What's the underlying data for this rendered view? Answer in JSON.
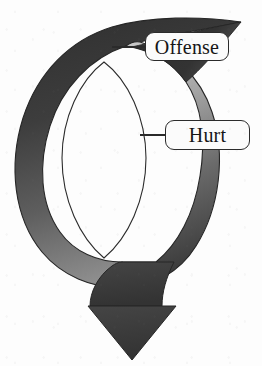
{
  "diagram": {
    "type": "cyclical-loop-arrow",
    "background_color": "#fdfdfd",
    "callouts": [
      {
        "id": "offense",
        "label": "Offense",
        "position": "upper-right",
        "border_color": "#2b2b2b",
        "fill_color": "#fbfbfb",
        "text_color": "#161616",
        "leader_line": true
      },
      {
        "id": "hurt",
        "label": "Hurt",
        "position": "middle-right",
        "border_color": "#2b2b2b",
        "fill_color": "#fbfbfb",
        "text_color": "#161616",
        "leader_line": true
      }
    ],
    "shape": {
      "arrow_fill_dark": "#3a3a3a",
      "arrow_fill_mid": "#6e6e6e",
      "arrow_fill_light": "#b8b8b8",
      "arrow_outline": "#2b2b2b",
      "inner_hole_color": "#fdfdfd",
      "arrowhead_direction": "down",
      "arrowhead_fill": "#3b3b3b"
    }
  }
}
